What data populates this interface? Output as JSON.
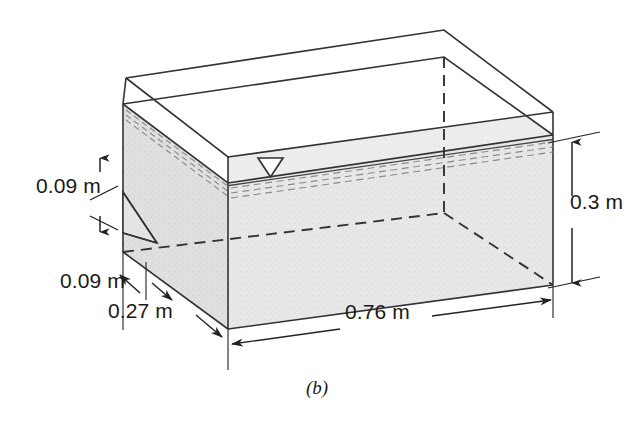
{
  "figure": {
    "caption": "(b)",
    "type": "isometric-3d-soil-tank-diagram"
  },
  "colors": {
    "line": "#333333",
    "soil_fill": "#e6e6e6",
    "soil_fill_top": "#ededed",
    "soil_fill_left": "#dcdcdc",
    "background": "#ffffff",
    "text": "#1a1a1a"
  },
  "dimensions": [
    {
      "id": "h1",
      "value": "0.09 m",
      "measures": "upper-left-vertical-offset"
    },
    {
      "id": "h2",
      "value": "0.09 m",
      "measures": "lower-left-horizontal-offset"
    },
    {
      "id": "w1",
      "value": "0.27 m",
      "measures": "tank-width-front-left-edge"
    },
    {
      "id": "w2",
      "value": "0.76 m",
      "measures": "tank-length-bottom-front-edge"
    },
    {
      "id": "d1",
      "value": "0.3 m",
      "measures": "soil-depth-right-vertical"
    }
  ],
  "symbols": [
    {
      "name": "water-table-triangle",
      "meaning": "phreatic surface / water table level"
    }
  ]
}
